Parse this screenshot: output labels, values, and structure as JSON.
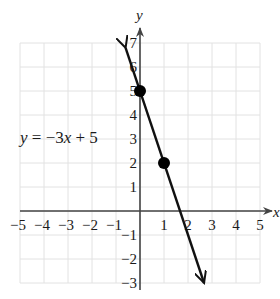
{
  "chart_data": {
    "type": "line",
    "title": "",
    "xlabel": "x",
    "ylabel": "y",
    "xlim": [
      -5,
      5
    ],
    "ylim": [
      -3,
      7
    ],
    "grid": true,
    "x_ticks": [
      "-5",
      "-4",
      "-3",
      "-2",
      "-1",
      "1",
      "2",
      "3",
      "4",
      "5"
    ],
    "y_ticks": [
      "7",
      "6",
      "5",
      "4",
      "3",
      "2",
      "1",
      "-1",
      "-2",
      "-3"
    ],
    "series": [
      {
        "name": "y = -3x + 5",
        "equation": "y = −3x + 5",
        "slope": -3,
        "intercept": 5,
        "x": [
          -0.6,
          2.67
        ],
        "y": [
          6.8,
          -3
        ],
        "arrows": "both"
      }
    ],
    "points": [
      {
        "x": 0,
        "y": 5
      },
      {
        "x": 1,
        "y": 2
      }
    ],
    "annotations": [
      {
        "text": "y = −3x + 5",
        "position": "left of line, near y=3"
      }
    ]
  },
  "labels": {
    "x_axis": "x",
    "y_axis": "y",
    "equation_y": "y",
    "equation_eq": " = −3",
    "equation_x": "x",
    "equation_rest": " + 5"
  },
  "ticks": {
    "x": [
      {
        "label": "−5",
        "v": -5
      },
      {
        "label": "−4",
        "v": -4
      },
      {
        "label": "−3",
        "v": -3
      },
      {
        "label": "−2",
        "v": -2
      },
      {
        "label": "−1",
        "v": -1
      },
      {
        "label": "1",
        "v": 1
      },
      {
        "label": "2",
        "v": 2
      },
      {
        "label": "3",
        "v": 3
      },
      {
        "label": "4",
        "v": 4
      },
      {
        "label": "5",
        "v": 5
      }
    ],
    "y": [
      {
        "label": "7",
        "v": 7
      },
      {
        "label": "6",
        "v": 6
      },
      {
        "label": "5",
        "v": 5
      },
      {
        "label": "4",
        "v": 4
      },
      {
        "label": "3",
        "v": 3
      },
      {
        "label": "2",
        "v": 2
      },
      {
        "label": "1",
        "v": 1
      },
      {
        "label": "−1",
        "v": -1
      },
      {
        "label": "−2",
        "v": -2
      },
      {
        "label": "−3",
        "v": -3
      }
    ]
  },
  "colors": {
    "grid": "#e2e2e2",
    "axis": "#444444",
    "line": "#111111",
    "point": "#000000"
  }
}
